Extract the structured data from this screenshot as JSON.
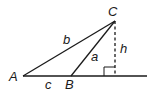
{
  "diagram": {
    "type": "triangle-geometry",
    "vertices": [
      {
        "label": "A",
        "x": 23,
        "y": 76
      },
      {
        "label": "B",
        "x": 71,
        "y": 76
      },
      {
        "label": "C",
        "x": 115,
        "y": 21
      }
    ],
    "sides": [
      {
        "label": "a",
        "from": "B",
        "to": "C"
      },
      {
        "label": "b",
        "from": "A",
        "to": "C"
      },
      {
        "label": "c",
        "from": "A",
        "to": "B"
      }
    ],
    "height": {
      "label": "h",
      "from": "C",
      "foot_x": 115,
      "foot_y": 76,
      "style": "dashed"
    },
    "right_angle_marker": true,
    "line_color": "#1a1a1a"
  }
}
